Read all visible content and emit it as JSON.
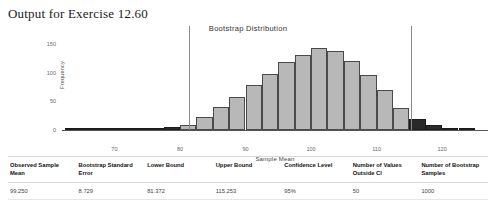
{
  "page": {
    "title": "Output for Exercise 12.60"
  },
  "chart_data": {
    "type": "bar",
    "title": "Bootstrap Distribution",
    "xlabel": "Sample Mean",
    "ylabel": "Frequency",
    "xlim": [
      62,
      127
    ],
    "ylim": [
      0,
      160
    ],
    "grid": false,
    "legend": null,
    "bin_width": 2.5,
    "x_ticks": [
      "70",
      "80",
      "90",
      "100",
      "110",
      "120"
    ],
    "x_tick_values": [
      70,
      80,
      90,
      100,
      110,
      120
    ],
    "y_ticks": [
      "0",
      "50",
      "100",
      "150"
    ],
    "y_tick_values": [
      0,
      50,
      100,
      150
    ],
    "bar_color": "#b8b8b8",
    "outside_ci_color": "#2a2a2a",
    "ci_line_color": "#8a8a8a",
    "categories": [
      "63.75",
      "66.25",
      "68.75",
      "71.25",
      "73.75",
      "76.25",
      "78.75",
      "81.25",
      "83.75",
      "86.25",
      "88.75",
      "91.25",
      "93.75",
      "96.25",
      "98.75",
      "101.25",
      "103.75",
      "106.25",
      "108.75",
      "111.25",
      "113.75",
      "116.25",
      "118.75",
      "121.25",
      "123.75"
    ],
    "values": [
      1,
      1,
      2,
      2,
      3,
      4,
      6,
      9,
      22,
      40,
      58,
      78,
      98,
      118,
      130,
      142,
      138,
      120,
      96,
      70,
      38,
      20,
      9,
      4,
      2
    ],
    "outside_ci_flags": [
      true,
      true,
      true,
      true,
      true,
      true,
      true,
      false,
      false,
      false,
      false,
      false,
      false,
      false,
      false,
      false,
      false,
      false,
      false,
      false,
      false,
      true,
      true,
      true,
      true
    ],
    "ci_lines": [
      81.372,
      115.253
    ],
    "annotations": [
      "Vertical reference lines mark the lower and upper bootstrap confidence bounds",
      "Dark bars show bootstrap sample means falling outside the confidence interval"
    ]
  },
  "stats_table": {
    "headers": [
      "Observed Sample Mean",
      "Bootstrap Standard Error",
      "Lower Bound",
      "Upper Bound",
      "Confidence Level",
      "Number of Values Outside CI",
      "Number of Bootstrap Samples"
    ],
    "row": [
      "99.250",
      "8.729",
      "81.372",
      "115.253",
      "95%",
      "50",
      "1000"
    ]
  }
}
